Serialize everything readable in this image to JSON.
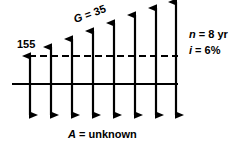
{
  "diagram": {
    "labels": {
      "present_value": "155",
      "gradient": "G = 35",
      "periods": "n = 8 yr",
      "interest": "i = 6%",
      "annual": "A = unknown"
    },
    "colors": {
      "stroke": "#000000",
      "background": "#ffffff"
    }
  },
  "chart_data": {
    "type": "bar",
    "xlabel": "",
    "ylabel": "",
    "baseline_y": 84,
    "dashed_line_y": 56,
    "categories": [
      "1",
      "2",
      "3",
      "4",
      "5",
      "6",
      "7",
      "8"
    ],
    "up_arrow_x": [
      30,
      51,
      72,
      93,
      114,
      135,
      156,
      176
    ],
    "up_arrow_tip_y": [
      56,
      47,
      39,
      31,
      23,
      15,
      8,
      2
    ],
    "down_arrow_tip_y": [
      115,
      115,
      115,
      115,
      115,
      115,
      115,
      115
    ],
    "dashed_line_x_start": 29,
    "dashed_line_x_end": 178,
    "baseline_x_start": 12,
    "baseline_x_end": 178,
    "annotations": [
      {
        "text": "155",
        "x": 17,
        "y": 39
      },
      {
        "text": "G = 35",
        "x": 76,
        "y": 14,
        "rotation": -20
      },
      {
        "text": "n = 8 yr",
        "x": 189,
        "y": 29
      },
      {
        "text": "i = 6%",
        "x": 189,
        "y": 45
      },
      {
        "text": "A = unknown",
        "x": 68,
        "y": 129
      }
    ]
  }
}
